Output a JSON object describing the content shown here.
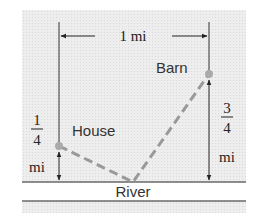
{
  "diagram": {
    "title": "",
    "top_dimension": {
      "label": "1 mi"
    },
    "left_dimension": {
      "numerator": "1",
      "denominator": "4",
      "unit": "mi"
    },
    "right_dimension": {
      "numerator": "3",
      "denominator": "4",
      "unit": "mi"
    },
    "points": {
      "house": {
        "label": "House"
      },
      "barn": {
        "label": "Barn"
      }
    },
    "river": {
      "label": "River"
    },
    "colors": {
      "background": "#eeeeee",
      "lines": "#222222",
      "path_dashed": "#999999",
      "points": "#aaaaaa"
    }
  }
}
